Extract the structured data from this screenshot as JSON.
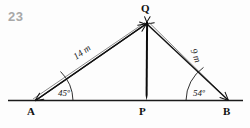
{
  "figure": {
    "item_number": "23",
    "type": "geometry-diagram",
    "colors": {
      "ink": "#111111",
      "line": "#1a1a1a",
      "background": "#fdfdfd",
      "item_number": "#a8a8a8"
    },
    "vertices": [
      {
        "name": "A",
        "label": "A",
        "x": 31,
        "y": 108
      },
      {
        "name": "P",
        "label": "P",
        "x": 143,
        "y": 108
      },
      {
        "name": "B",
        "label": "B",
        "x": 227,
        "y": 108
      },
      {
        "name": "Q",
        "label": "Q",
        "x": 146,
        "y": 18
      }
    ],
    "angles": [
      {
        "at": "A",
        "label": "45º",
        "value": 45,
        "unit": "degrees"
      },
      {
        "at": "B",
        "label": "54º",
        "value": 54,
        "unit": "degrees"
      }
    ],
    "lengths": [
      {
        "segment": "AQ",
        "label": "14 m",
        "value": 14,
        "unit": "m",
        "rotation": -38
      },
      {
        "segment": "QB",
        "label": "9 m",
        "value": 9,
        "unit": "m",
        "rotation": 54
      }
    ],
    "segments": [
      {
        "name": "baseline-AB",
        "from": "A-extended",
        "to": "B-extended"
      },
      {
        "name": "altitude-QP",
        "from": "Q",
        "to": "P",
        "style": "bold"
      },
      {
        "name": "side-AQ",
        "from": "A",
        "to": "Q",
        "style": "double-arrow"
      },
      {
        "name": "side-QB",
        "from": "Q",
        "to": "B",
        "style": "double-arrow"
      }
    ]
  }
}
